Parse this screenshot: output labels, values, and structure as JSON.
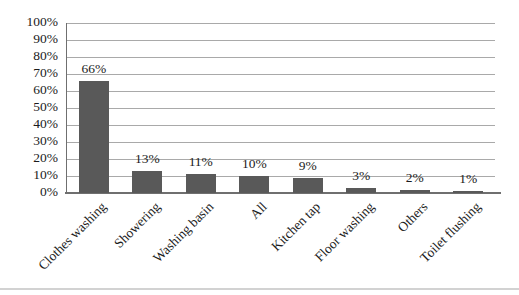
{
  "chart_data": {
    "type": "bar",
    "title": "",
    "xlabel": "",
    "ylabel": "",
    "legend": "none",
    "grid": "horizontal gridlines every 10%",
    "ylim": [
      0,
      100
    ],
    "categories": [
      "Clothes washing",
      "Showering",
      "Washing basin",
      "All",
      "Kitchen tap",
      "Floor washing",
      "Others",
      "Toilet flushing"
    ],
    "values": [
      66,
      13,
      11,
      10,
      9,
      3,
      2,
      1
    ],
    "value_labels": [
      "66%",
      "13%",
      "11%",
      "10%",
      "9%",
      "3%",
      "2%",
      "1%"
    ],
    "y_tick_values": [
      0,
      10,
      20,
      30,
      40,
      50,
      60,
      70,
      80,
      90,
      100
    ],
    "y_tick_labels": [
      "0%",
      "10%",
      "20%",
      "30%",
      "40%",
      "50%",
      "60%",
      "70%",
      "80%",
      "90%",
      "100%"
    ],
    "colors": {
      "bar": "#595959",
      "gridline": "#a9a9a9",
      "axis": "#6f6f6f",
      "text": "#1b1b1b",
      "background": "#ffffff",
      "scan_edge": "#d2d2d2"
    }
  }
}
